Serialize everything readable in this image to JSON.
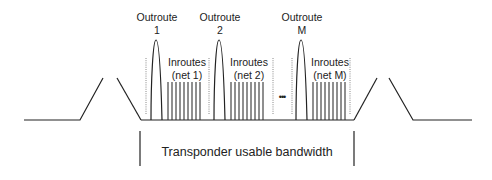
{
  "diagram": {
    "outroutes": [
      {
        "title": "Outroute",
        "index": "1",
        "x": 156
      },
      {
        "title": "Outroute",
        "index": "2",
        "x": 219
      },
      {
        "title": "Outroute",
        "index": "M",
        "x": 301
      }
    ],
    "inroutes": [
      {
        "title": "Inroutes",
        "net": "(net 1)",
        "x": 184
      },
      {
        "title": "Inroutes",
        "net": "(net 2)",
        "x": 248
      },
      {
        "title": "Inroutes",
        "net": "(net M)",
        "x": 330
      }
    ],
    "ellipsis": "•••",
    "bandwidth_label": "Transponder usable bandwidth",
    "colors": {
      "line": "#222222",
      "dotted": "#888888"
    }
  }
}
